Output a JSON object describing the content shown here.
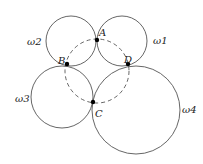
{
  "diagram": {
    "circles": [
      {
        "name": "ω1",
        "cx": 122,
        "cy": 41,
        "r": 25,
        "label_x": 153,
        "label_y": 44
      },
      {
        "name": "ω2",
        "cx": 71,
        "cy": 41,
        "r": 25,
        "label_x": 26,
        "label_y": 45
      },
      {
        "name": "ω3",
        "cx": 62,
        "cy": 97,
        "r": 31,
        "label_x": 14,
        "label_y": 102
      },
      {
        "name": "ω4",
        "cx": 136,
        "cy": 110,
        "r": 44,
        "label_x": 182,
        "label_y": 112
      }
    ],
    "points": [
      {
        "name": "A",
        "x": 97,
        "y": 40,
        "label_x": 99,
        "label_y": 36
      },
      {
        "name": "B",
        "x": 67,
        "y": 64,
        "label_x": 58,
        "label_y": 63
      },
      {
        "name": "C",
        "x": 93,
        "y": 102,
        "label_x": 95,
        "label_y": 116
      },
      {
        "name": "D",
        "x": 128,
        "y": 64,
        "label_x": 124,
        "label_y": 63
      }
    ],
    "dashed_circle": {
      "cx": 97,
      "cy": 70,
      "r": 32
    }
  }
}
